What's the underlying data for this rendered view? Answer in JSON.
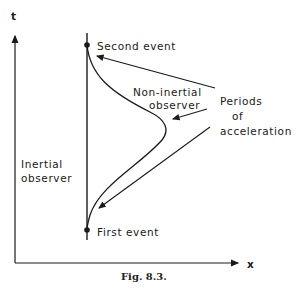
{
  "axes": {
    "y_label": "t",
    "x_label": "x"
  },
  "labels": {
    "second_event": "Second event",
    "first_event": "First event",
    "non_inertial_1": "Non-inertial",
    "non_inertial_2": "observer",
    "periods_1": "Periods",
    "periods_2": "of",
    "periods_3": "acceleration",
    "inertial_1": "Inertial",
    "inertial_2": "observer"
  },
  "caption": "Fig. 8.3.",
  "colors": {
    "ink": "#1a1a1a",
    "background": "#ffffff"
  }
}
